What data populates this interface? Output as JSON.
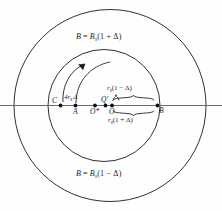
{
  "figure": {
    "type": "diagram",
    "background": "#fefefe",
    "line_color": "#1a1a1a",
    "axis_color": "#5a5a5a"
  },
  "labels": {
    "outer_field": {
      "lhs": "B",
      "eq": "=",
      "rhs_base": "B",
      "rhs_sub": "s",
      "rhs_paren": "(1 + Δ)"
    },
    "inner_field": {
      "lhs": "B",
      "eq": "=",
      "rhs_base": "B",
      "rhs_sub": "s",
      "rhs_paren": "(1 − Δ)"
    },
    "gap_dim": {
      "base": "4r",
      "sub": "s",
      "tail": "Δ"
    },
    "brace_upper": {
      "base": "r",
      "sub": "s",
      "tail": "(1 − Δ)"
    },
    "brace_lower": {
      "base": "r",
      "sub": "s",
      "tail": "(1 + Δ)"
    }
  },
  "points": [
    {
      "id": "C",
      "label": "C",
      "x": 60.5,
      "y": 105.5,
      "label_dx": -8,
      "label_dy": -9
    },
    {
      "id": "A",
      "label": "A",
      "x": 75.5,
      "y": 105.5,
      "label_dx": -2.5,
      "label_dy": 2
    },
    {
      "id": "Ostar",
      "label": "O*",
      "x": 95.0,
      "y": 105.5,
      "label_dx": -5,
      "label_dy": 2
    },
    {
      "id": "Qprime",
      "label": "Q′",
      "x": 105.5,
      "y": 105.5,
      "label_dx": -4,
      "label_dy": -9
    },
    {
      "id": "O",
      "label": "O",
      "x": 112.0,
      "y": 105.5,
      "label_dx": -3,
      "label_dy": 2
    },
    {
      "id": "B",
      "label": "B",
      "x": 157.5,
      "y": 105.5,
      "label_dx": 2,
      "label_dy": 2
    }
  ],
  "circles": [
    {
      "id": "outer-circle",
      "cx": 110,
      "cy": 105.5,
      "r": 96
    },
    {
      "id": "inner-circle",
      "cx": 104,
      "cy": 105.5,
      "r": 56
    }
  ],
  "axis": {
    "x1": 0,
    "y": 105.5,
    "x2": 222
  },
  "arrow": {
    "id": "rotation-arrow",
    "from_x": 63,
    "from_y": 101,
    "to_x": 88,
    "to_y": 63
  },
  "braces": [
    {
      "id": "brace-upper",
      "x1": 112,
      "x2": 155,
      "y": 99,
      "direction": "up"
    },
    {
      "id": "brace-lower",
      "x1": 112,
      "x2": 155,
      "y": 112,
      "direction": "down"
    }
  ]
}
